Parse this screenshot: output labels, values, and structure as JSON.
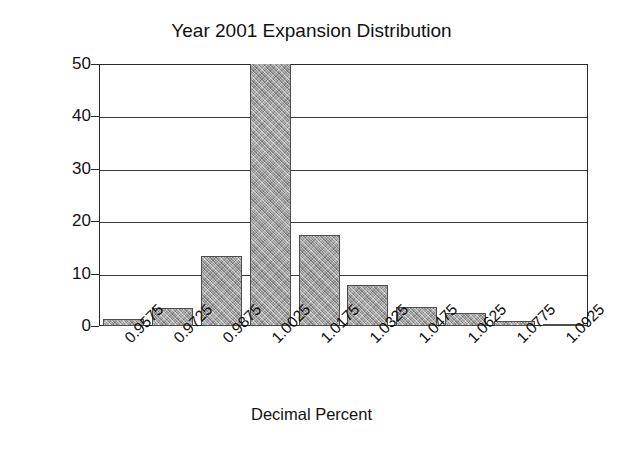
{
  "chart_data": {
    "type": "bar",
    "title": "Year 2001 Expansion Distribution",
    "xlabel": "Decimal Percent",
    "ylabel": "% of Success Cases",
    "categories": [
      "0.9575",
      "0.9725",
      "0.9875",
      "1.0025",
      "1.0175",
      "1.0325",
      "1.0475",
      "1.0625",
      "1.0775",
      "1.0925"
    ],
    "values": [
      1.3,
      3.4,
      13.4,
      50.0,
      17.3,
      7.9,
      3.6,
      2.4,
      1.0,
      0.3
    ],
    "value_notes": "bar at 1.0025 is clipped by the top of the plot frame (>= 50)",
    "ylim": [
      0,
      50
    ],
    "yticks": [
      0,
      10,
      20,
      30,
      40,
      50
    ],
    "ytick_labels": [
      "0",
      "10",
      "20",
      "30",
      "40",
      "50"
    ],
    "grid": "horizontal",
    "legend": "none",
    "bar_fill_color": "#9d9d9d",
    "bar_border_color": "#4d4d4d",
    "axis_color": "#2a2a2a",
    "background_color": "#ffffff"
  }
}
